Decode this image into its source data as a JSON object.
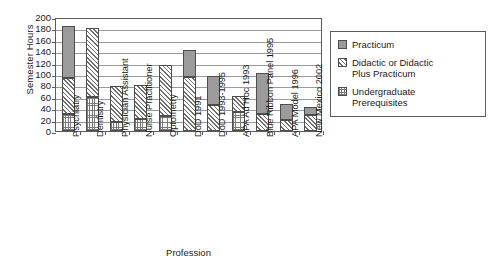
{
  "chart_data": {
    "type": "bar",
    "subtype": "stacked",
    "title": "",
    "xlabel": "Profession",
    "ylabel": "Semester Hours",
    "ylim": [
      0,
      200
    ],
    "ytick_step": 20,
    "yticks": [
      200,
      180,
      160,
      140,
      120,
      100,
      80,
      60,
      40,
      20,
      0
    ],
    "grid": true,
    "legend_position": "right",
    "categories": [
      "Psychiatry",
      "Dentistry",
      "Physician Assistant",
      "Nurse Practitioner",
      "Optometry",
      "DoD 1991",
      "DoD 1993-1995",
      "APA Ad Hoc 1993",
      "Blue Ribbon Panel 1995",
      "APA Model 1996",
      "New Mexico 2002"
    ],
    "series": [
      {
        "name": "Undergraduate Prerequisites",
        "pattern": "fine-dot-grid",
        "color": "#ffffff",
        "values": [
          30,
          60,
          15,
          21,
          27,
          0,
          0,
          34,
          0,
          0,
          0
        ]
      },
      {
        "name": "Didactic or Didactic Plus Practicum",
        "pattern": "diagonal-hatch",
        "color": "#ffffff",
        "values": [
          63,
          120,
          64,
          59,
          88,
          95,
          46,
          27,
          30,
          20,
          28
        ]
      },
      {
        "name": "Practicum",
        "pattern": "solid-gray",
        "color": "#9b9b9b",
        "values": [
          92,
          0,
          0,
          0,
          0,
          47,
          50,
          0,
          72,
          27,
          15
        ]
      }
    ],
    "totals": [
      185,
      180,
      79,
      80,
      115,
      142,
      96,
      61,
      102,
      47,
      43
    ],
    "axis_color": "#5c5c5c",
    "grid_color": "#9a9a9a"
  },
  "legend": {
    "items": [
      {
        "label": "Practicum",
        "swatch": "solid-gray-swatch"
      },
      {
        "label": "Didactic or Didactic\nPlus Practicum",
        "swatch": "diagonal-hatch-swatch"
      },
      {
        "label": "Undergraduate\nPrerequisites",
        "swatch": "fine-dot-grid-swatch"
      }
    ]
  }
}
